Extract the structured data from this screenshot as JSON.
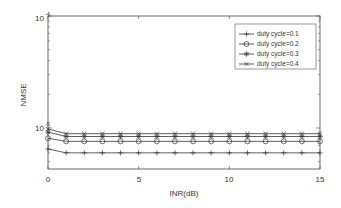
{
  "chart_data": {
    "type": "line",
    "title": "",
    "xlabel": "INR(dB)",
    "ylabel": "NMSE",
    "xlim": [
      0,
      15
    ],
    "ylim": [
      4.3e-06,
      0.0001
    ],
    "yscale": "log",
    "x_ticks": [
      "0",
      "5",
      "10",
      "15"
    ],
    "y_ticks": [
      {
        "base": "10",
        "exp": "-4"
      },
      {
        "base": "10",
        "exp": "-5"
      }
    ],
    "grid": false,
    "legend_position": "upper right",
    "x": [
      0,
      1,
      2,
      3,
      4,
      5,
      6,
      7,
      8,
      9,
      10,
      11,
      12,
      13,
      14,
      15
    ],
    "series": [
      {
        "name": "duty cycle=0.1",
        "marker": "+",
        "values": [
          6.5e-06,
          6e-06,
          6e-06,
          6e-06,
          6e-06,
          6e-06,
          6e-06,
          6e-06,
          6e-06,
          6e-06,
          6e-06,
          6e-06,
          6e-06,
          6e-06,
          6e-06,
          6e-06
        ]
      },
      {
        "name": "duty cycle=0.2",
        "marker": "o",
        "values": [
          8.1e-06,
          7.6e-06,
          7.6e-06,
          7.6e-06,
          7.6e-06,
          7.6e-06,
          7.6e-06,
          7.6e-06,
          7.6e-06,
          7.6e-06,
          7.6e-06,
          7.6e-06,
          7.6e-06,
          7.6e-06,
          7.6e-06,
          7.6e-06
        ]
      },
      {
        "name": "duty cycle=0.3",
        "marker": "*",
        "values": [
          9.2e-06,
          8.4e-06,
          8.4e-06,
          8.4e-06,
          8.4e-06,
          8.4e-06,
          8.4e-06,
          8.4e-06,
          8.4e-06,
          8.4e-06,
          8.4e-06,
          8.4e-06,
          8.4e-06,
          8.4e-06,
          8.4e-06,
          8.4e-06
        ]
      },
      {
        "name": "duty cycle=0.4",
        "marker": "x",
        "values": [
          9.8e-06,
          8.9e-06,
          8.9e-06,
          8.9e-06,
          8.9e-06,
          8.9e-06,
          8.9e-06,
          8.9e-06,
          8.9e-06,
          8.9e-06,
          8.9e-06,
          8.9e-06,
          8.9e-06,
          8.9e-06,
          8.9e-06,
          8.9e-06
        ]
      }
    ]
  }
}
